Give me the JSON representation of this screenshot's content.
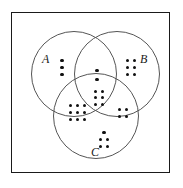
{
  "figure": {
    "type": "venn-diagram",
    "sets": [
      "A",
      "B",
      "C"
    ],
    "label_a": "A",
    "label_b": "B",
    "label_c": "C",
    "dot_color": "#101010",
    "circle_stroke": "#555555",
    "frame_stroke": "#1a1a1a",
    "background": "#ffffff"
  },
  "regions": [
    {
      "id": "a-only",
      "label": "A only",
      "count": 3,
      "columns": 1,
      "rows": 3
    },
    {
      "id": "b-only",
      "label": "B only",
      "count": 6,
      "columns": 2,
      "rows": 3
    },
    {
      "id": "ab-only",
      "label": "A and B only",
      "count": 2,
      "columns": 1,
      "rows": 2
    },
    {
      "id": "abc",
      "label": "A and B and C",
      "count": 6,
      "columns": 2,
      "rows": 3
    },
    {
      "id": "ac-only",
      "label": "A and C only",
      "count": 9,
      "columns": 3,
      "rows": 3
    },
    {
      "id": "bc-only",
      "label": "B and C only",
      "count": 4,
      "columns": 2,
      "rows": 2
    },
    {
      "id": "c-only-top",
      "label": "C only top dot",
      "count": 1,
      "columns": 1,
      "rows": 1
    },
    {
      "id": "c-only-grid",
      "label": "C only grid",
      "count": 4,
      "columns": 2,
      "rows": 2
    }
  ],
  "counts": {
    "a_only": 3,
    "b_only": 6,
    "ab_only": 2,
    "abc": 6,
    "ac_only": 9,
    "bc_only": 4,
    "c_only": 5,
    "total": 35
  }
}
